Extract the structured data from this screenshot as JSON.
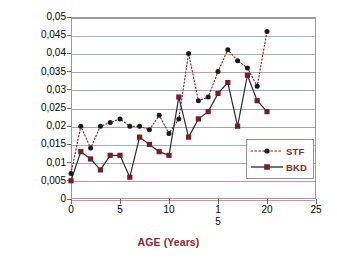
{
  "chart_data": {
    "type": "line",
    "title": "",
    "xlabel": "AGE (Years)",
    "ylabel": "CASUALTY RATE",
    "xlim": [
      0,
      25
    ],
    "ylim": [
      0,
      0.05
    ],
    "grid": true,
    "legend_position": "inside-right",
    "decimal_separator": ",",
    "x_tick_labels": [
      "0",
      "5",
      "10",
      "15",
      "20",
      "25"
    ],
    "x_tick_values": [
      0,
      5,
      10,
      15,
      20,
      25
    ],
    "y_tick_labels": [
      "0",
      "0,005",
      "0,01",
      "0,015",
      "0,02",
      "0,025",
      "0,03",
      "0,035",
      "0,04",
      "0,045",
      "0,05"
    ],
    "y_tick_values": [
      0,
      0.005,
      0.01,
      0.015,
      0.02,
      0.025,
      0.03,
      0.035,
      0.04,
      0.045,
      0.05
    ],
    "x": [
      0,
      1,
      2,
      3,
      4,
      5,
      6,
      7,
      8,
      9,
      10,
      11,
      12,
      13,
      14,
      15,
      16,
      17,
      18,
      19,
      20
    ],
    "series": [
      {
        "name": "STF",
        "style": "dotted",
        "marker": "circle",
        "color": "#1a1a1a",
        "values": [
          0.007,
          0.02,
          0.014,
          0.02,
          0.021,
          0.022,
          0.02,
          0.02,
          0.019,
          0.023,
          0.018,
          0.022,
          0.04,
          0.027,
          0.028,
          0.035,
          0.041,
          0.038,
          0.036,
          0.031,
          0.046
        ]
      },
      {
        "name": "BKD",
        "style": "solid",
        "marker": "square",
        "color": "#7b1b24",
        "values": [
          0.005,
          0.013,
          0.011,
          0.008,
          0.012,
          0.012,
          0.006,
          0.017,
          0.015,
          0.013,
          0.012,
          0.028,
          0.017,
          0.022,
          0.024,
          0.029,
          0.032,
          0.02,
          0.034,
          0.027,
          0.024
        ]
      }
    ]
  },
  "legend": {
    "items": [
      {
        "label": "STF"
      },
      {
        "label": "BKD"
      }
    ]
  },
  "colors": {
    "axis_title": "#8d2330",
    "plot_border": "#9a9a9a",
    "stf": "#1a1a1a",
    "bkd": "#7b1b24",
    "legend_border": "#8a8fb5"
  }
}
